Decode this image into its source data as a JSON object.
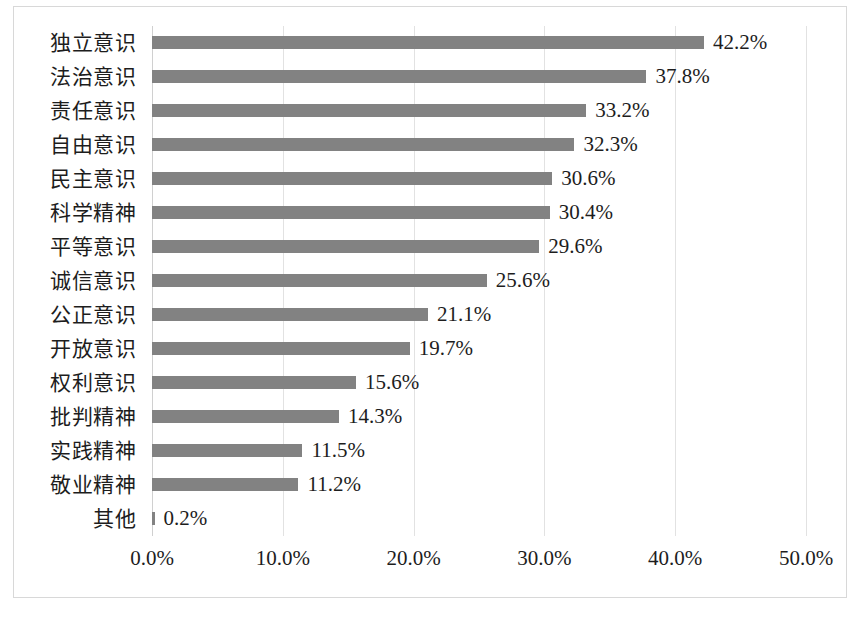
{
  "chart_data": {
    "type": "bar",
    "orientation": "horizontal",
    "title": "",
    "subtitle": "",
    "xlabel": "",
    "ylabel": "",
    "xlim": [
      0,
      50
    ],
    "xtick_labels": [
      "0.0%",
      "10.0%",
      "20.0%",
      "30.0%",
      "40.0%",
      "50.0%"
    ],
    "xticks": [
      0,
      10,
      20,
      30,
      40,
      50
    ],
    "grid": true,
    "grid_axis": "x",
    "legend": false,
    "legend_position": "none",
    "value_label_suffix": "%",
    "bar_color": "#828282",
    "categories": [
      "独立意识",
      "法治意识",
      "责任意识",
      "自由意识",
      "民主意识",
      "科学精神",
      "平等意识",
      "诚信意识",
      "公正意识",
      "开放意识",
      "权利意识",
      "批判精神",
      "实践精神",
      "敬业精神",
      "其他"
    ],
    "values": [
      42.2,
      37.8,
      33.2,
      32.3,
      30.6,
      30.4,
      29.6,
      25.6,
      21.1,
      19.7,
      15.6,
      14.3,
      11.5,
      11.2,
      0.2
    ],
    "value_labels": [
      "42.2%",
      "37.8%",
      "33.2%",
      "32.3%",
      "30.6%",
      "30.4%",
      "29.6%",
      "25.6%",
      "21.1%",
      "19.7%",
      "15.6%",
      "14.3%",
      "11.5%",
      "11.2%",
      "0.2%"
    ]
  }
}
